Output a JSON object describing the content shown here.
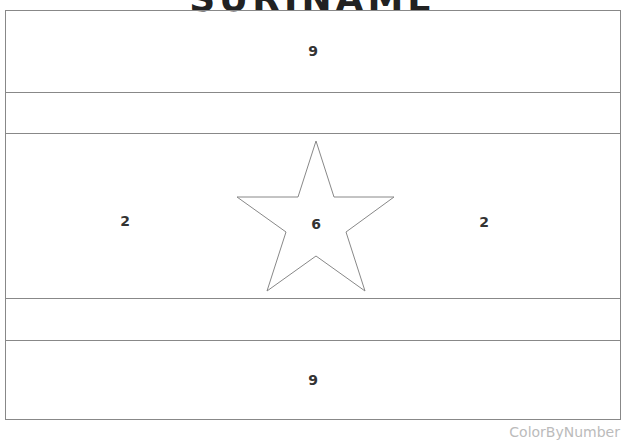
{
  "title": "SURINAME",
  "footer": "ColorByNumber",
  "regions": {
    "top_band": "9",
    "left_red": "2",
    "star": "6",
    "right_red": "2",
    "bottom_band": "9"
  }
}
